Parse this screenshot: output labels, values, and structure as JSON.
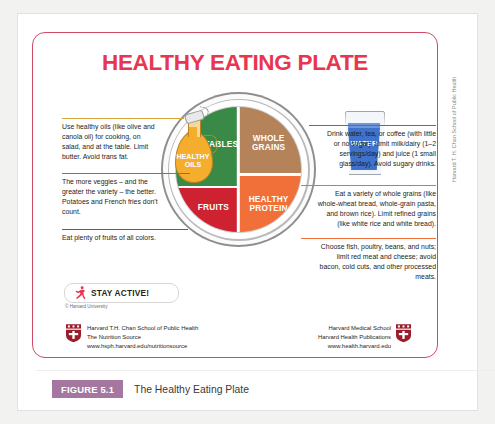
{
  "poster": {
    "title": "HEALTHY EATING PLATE",
    "plate": {
      "vegetables": "VEGETABLES",
      "fruits": "FRUITS",
      "whole_grains": "WHOLE\nGRAINS",
      "whole_grains_line1": "WHOLE",
      "whole_grains_line2": "GRAINS",
      "healthy_protein_line1": "HEALTHY",
      "healthy_protein_line2": "PROTEIN"
    },
    "oils": {
      "label_line1": "HEALTHY",
      "label_line2": "OILS",
      "color": "#f5ad2e"
    },
    "water": {
      "label": "WATER",
      "color": "#3f72c8"
    },
    "callouts": {
      "oils": "Use healthy oils (like olive and canola oil) for cooking, on salad, and at the table. Limit butter. Avoid trans fat.",
      "vegetables": "The more veggies – and the greater the variety – the better. Potatoes and French fries don't count.",
      "fruits": "Eat plenty of fruits of all colors.",
      "water": "Drink water, tea, or coffee (with little or no sugar). Limit milk/dairy (1–2 servings/day) and juice (1 small glass/day). Avoid sugary drinks.",
      "whole_grains": "Eat a variety of whole grains (like whole-wheat bread, whole-grain pasta, and brown rice). Limit refined grains (like white rice and white bread).",
      "healthy_protein": "Choose fish, poultry, beans, and nuts;  limit red meat and cheese; avoid bacon, cold cuts,  and other processed meats."
    },
    "stay_active": {
      "label": "STAY ACTIVE!",
      "icon": "running-figure-icon"
    },
    "copyright": "© Harvard University",
    "credit_left": {
      "line1": "Harvard T.H. Chan School of Public Health",
      "line2": "The Nutrition Source",
      "line3": "www.hsph.harvard.edu/nutritionsource"
    },
    "credit_right": {
      "line1": "Harvard Medical School",
      "line2": "Harvard Health Publications",
      "line3": "www.health.harvard.edu"
    }
  },
  "side_credit": "Harvard T. H. Chan School of Public Health",
  "figure": {
    "badge": "FIGURE 5.1",
    "caption": "The Healthy Eating Plate"
  },
  "colors": {
    "title_red": "#e8364f",
    "frame_red": "#cf4a63",
    "vegetables_green": "#3a8a47",
    "fruits_red": "#cf2230",
    "grains_brown": "#b5835a",
    "protein_orange": "#f1703a",
    "oils_gold": "#f5ad2e",
    "water_blue": "#3f72c8",
    "badge_purple": "#a3779f"
  }
}
